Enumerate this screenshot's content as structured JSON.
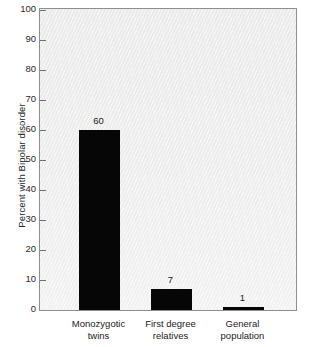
{
  "chart_data": {
    "type": "bar",
    "title": "",
    "xlabel": "",
    "ylabel": "Percent with Bipolar disorder",
    "categories": [
      "Monozygotic twins",
      "First degree relatives",
      "General population"
    ],
    "category_lines": [
      [
        "Monozygotic",
        "twins"
      ],
      [
        "First degree",
        "relatives"
      ],
      [
        "General",
        "population"
      ]
    ],
    "values": [
      60,
      7,
      1
    ],
    "value_labels": [
      "60",
      "7",
      "1"
    ],
    "ylim": [
      0,
      100
    ],
    "yticks": [
      0,
      10,
      20,
      30,
      40,
      50,
      60,
      70,
      80,
      90,
      100
    ],
    "ytick_labels": [
      "0",
      "10",
      "20",
      "30",
      "40",
      "50",
      "60",
      "70",
      "80",
      "90",
      "100"
    ],
    "grid": false,
    "legend": "none",
    "bar_color": "#060606",
    "plot_background": "#efefef",
    "frame_color": "#8e8e8e",
    "figure_background": "#ffffff"
  }
}
